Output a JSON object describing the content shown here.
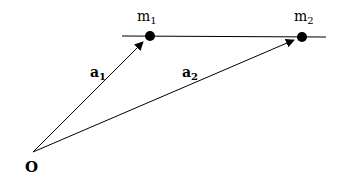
{
  "diagram": {
    "line_color": "#000000",
    "background": "#ffffff",
    "masses": [
      {
        "label": "m",
        "subscript": "1"
      },
      {
        "label": "m",
        "subscript": "2"
      }
    ],
    "vectors": [
      {
        "label": "a",
        "subscript": "1",
        "from": "O",
        "to": "m1"
      },
      {
        "label": "a",
        "subscript": "2",
        "from": "O",
        "to": "m2"
      }
    ],
    "origin_label": "O"
  }
}
